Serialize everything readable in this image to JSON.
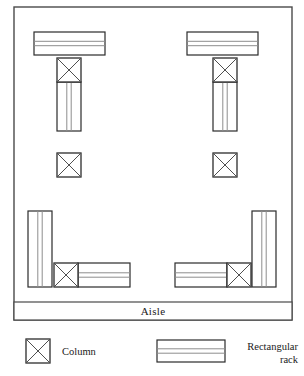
{
  "diagram": {
    "title_text": "",
    "type": "warehouse-layout-plan",
    "colors": {
      "outline": "#2b2b2b",
      "frame": "#4a4a4a",
      "rack_inner_line": "#8d8d8d",
      "column_cross": "#4f4f4f",
      "background": "#ffffff"
    },
    "frame": {
      "x": 14,
      "y": 7,
      "width": 278,
      "height": 313
    },
    "aisle": {
      "label": "Aisle",
      "band": {
        "x": 14,
        "y": 302,
        "width": 278,
        "height": 18
      },
      "label_x": 153,
      "label_y": 315
    },
    "racks": [
      {
        "name": "top-left-horizontal-rack",
        "x": 34,
        "y": 32,
        "width": 71,
        "height": 23,
        "orientation": "horizontal"
      },
      {
        "name": "top-left-vertical-rack",
        "x": 57,
        "y": 82,
        "width": 24,
        "height": 49,
        "orientation": "vertical"
      },
      {
        "name": "top-right-horizontal-rack",
        "x": 187,
        "y": 32,
        "width": 71,
        "height": 23,
        "orientation": "horizontal"
      },
      {
        "name": "top-right-vertical-rack",
        "x": 213,
        "y": 82,
        "width": 24,
        "height": 49,
        "orientation": "vertical"
      },
      {
        "name": "bottom-left-vertical-rack",
        "x": 28,
        "y": 211,
        "width": 24,
        "height": 76,
        "orientation": "vertical"
      },
      {
        "name": "bottom-left-horizontal-rack",
        "x": 78,
        "y": 263,
        "width": 52,
        "height": 24,
        "orientation": "horizontal"
      },
      {
        "name": "bottom-right-vertical-rack",
        "x": 252,
        "y": 211,
        "width": 24,
        "height": 76,
        "orientation": "vertical"
      },
      {
        "name": "bottom-right-horizontal-rack",
        "x": 175,
        "y": 263,
        "width": 52,
        "height": 24,
        "orientation": "horizontal"
      }
    ],
    "columns": [
      {
        "name": "top-left-column",
        "x": 57,
        "y": 58,
        "size": 24
      },
      {
        "name": "top-right-column",
        "x": 213,
        "y": 58,
        "size": 24
      },
      {
        "name": "middle-left-column",
        "x": 57,
        "y": 153,
        "size": 24
      },
      {
        "name": "middle-right-column",
        "x": 213,
        "y": 153,
        "size": 24
      },
      {
        "name": "bottom-left-column",
        "x": 54,
        "y": 263,
        "size": 24
      },
      {
        "name": "bottom-right-column",
        "x": 227,
        "y": 263,
        "size": 24
      }
    ]
  },
  "legend": {
    "column_entry": {
      "label": "Column",
      "swatch": {
        "x": 26,
        "y": 339,
        "size": 24
      },
      "label_x": 62,
      "label_y": 355
    },
    "rack_entry": {
      "label_line_1": "Rectangular",
      "label_line_2": "rack",
      "swatch": {
        "x": 157,
        "y": 340,
        "width": 68,
        "height": 22
      },
      "label_right_x": 298,
      "label_line_1_y": 350,
      "label_line_2_y": 363
    }
  }
}
